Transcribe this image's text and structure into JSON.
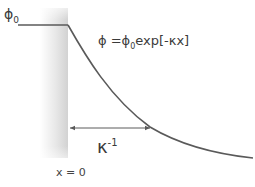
{
  "diagram": {
    "labels": {
      "phi0_base": "ϕ",
      "phi0_sub": "0",
      "formula_left": "ϕ =ϕ",
      "formula_sub": "0",
      "formula_right": "exp[-κx]",
      "kappa_base": "κ",
      "kappa_sup": "-1",
      "x0": "x = 0"
    },
    "colors": {
      "line": "#5a5a5a",
      "wall_dark": "#d6d6d6",
      "wall_light": "#ffffff",
      "text": "#3a3a3a"
    },
    "geometry": {
      "plateau_y": 25,
      "wall_x": 68,
      "decay_end": [
        253,
        158
      ],
      "arrow_y": 128,
      "arrow_end_x": 152
    }
  }
}
